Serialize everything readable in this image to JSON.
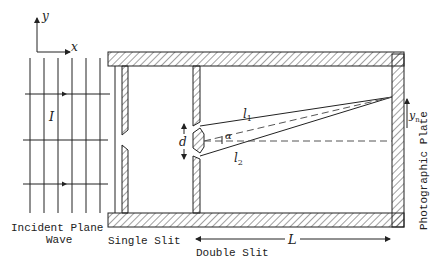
{
  "diagram": {
    "axes": {
      "y_label": "y",
      "x_label": "x"
    },
    "wave": {
      "intensity_label": "I",
      "caption_line1": "Incident Plane",
      "caption_line2": "Wave"
    },
    "single_slit": {
      "label": "Single Slit"
    },
    "double_slit": {
      "label": "Double Slit",
      "slit_separation_label": "d"
    },
    "paths": {
      "l1_label": "l",
      "l1_sub": "1",
      "l2_label": "l",
      "l2_sub": "2",
      "angle_label": "α"
    },
    "plate": {
      "label": "Photographic Plate",
      "position_label": "y",
      "position_sub": "n"
    },
    "distance": {
      "label": "L"
    },
    "colors": {
      "line": "#222222",
      "hatch": "#333333",
      "dashed": "#555555",
      "background": "#ffffff"
    }
  }
}
